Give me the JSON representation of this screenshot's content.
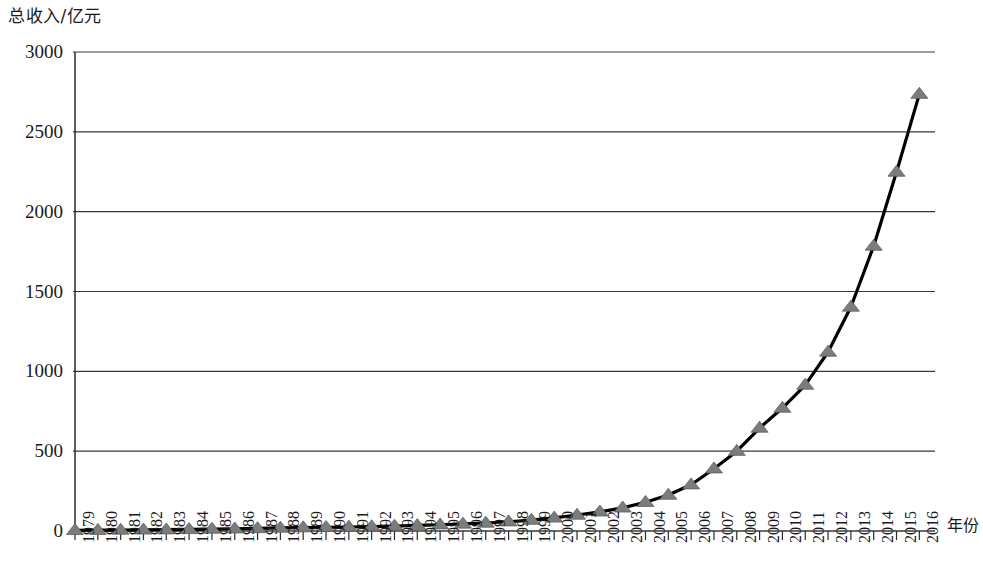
{
  "chart_data": {
    "type": "line",
    "title": "",
    "subtitle": "",
    "ylabel": "总收入/亿元",
    "xlabel": "年份",
    "ylim": [
      0,
      3000
    ],
    "ytick_step": 500,
    "yticks": [
      "0",
      "500",
      "1000",
      "1500",
      "2000",
      "2500",
      "3000"
    ],
    "grid": "horizontal",
    "legend": "none",
    "marker": "triangle",
    "marker_color": "#7c7c7c",
    "line_color": "#000000",
    "categories": [
      "1979",
      "1980",
      "1981",
      "1982",
      "1983",
      "1984",
      "1985",
      "1986",
      "1987",
      "1988",
      "1989",
      "1990",
      "1991",
      "1992",
      "1993",
      "1994",
      "1995",
      "1996",
      "1997",
      "1998",
      "1999",
      "2000",
      "2001",
      "2002",
      "2003",
      "2004",
      "2005",
      "2006",
      "2007",
      "2008",
      "2009",
      "2010",
      "2011",
      "2012",
      "2013",
      "2014",
      "2015",
      "2016"
    ],
    "values": [
      4,
      5,
      6,
      7,
      8,
      10,
      12,
      14,
      16,
      19,
      21,
      23,
      25,
      28,
      31,
      35,
      39,
      44,
      50,
      58,
      68,
      82,
      100,
      120,
      145,
      180,
      225,
      290,
      390,
      500,
      645,
      770,
      914,
      1121,
      1403,
      1785,
      2248,
      2736
    ]
  }
}
